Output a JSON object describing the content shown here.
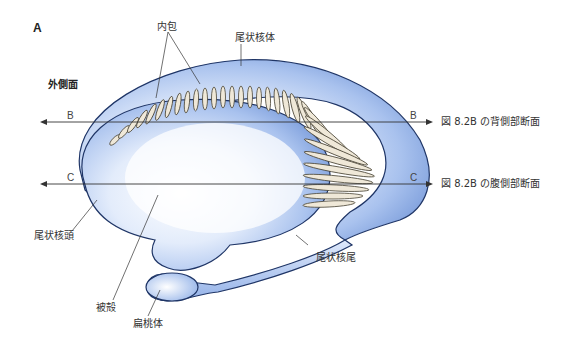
{
  "figure": {
    "panel_label": "A",
    "view_label": "外側面",
    "structures": {
      "internal_capsule": "内包",
      "caudate_body": "尾状核体",
      "caudate_head": "尾状核頭",
      "putamen": "被殻",
      "caudate_tail": "尾状核尾",
      "amygdala": "扁桃体"
    },
    "planes": {
      "b": {
        "letter": "B",
        "reference": "図 8.2B の背側部断面"
      },
      "c": {
        "letter": "C",
        "reference": "図 8.2B の腹側部断面"
      }
    },
    "colors": {
      "body_fill": "#b9cdf0",
      "outline": "#1f3566",
      "fiber": "#c9bfa6"
    }
  }
}
